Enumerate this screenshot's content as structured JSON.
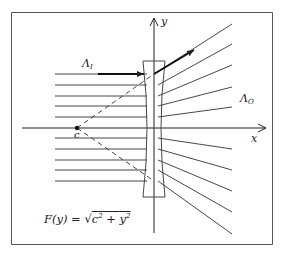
{
  "figure": {
    "type": "optics-diagram",
    "axes": {
      "x_label": "x",
      "y_label": "y"
    },
    "labels": {
      "incoming_bundle": {
        "main": "Λ",
        "sub": "I"
      },
      "outgoing_bundle": {
        "main": "Λ",
        "sub": "O"
      },
      "point": "c"
    },
    "formula": {
      "lhs": "F(y) = ",
      "radicand_a": "c",
      "radicand_op": " + ",
      "radicand_b": "y",
      "exp": "2"
    },
    "colors": {
      "stroke": "#222222",
      "frame": "#555555",
      "background": "#ffffff"
    }
  }
}
